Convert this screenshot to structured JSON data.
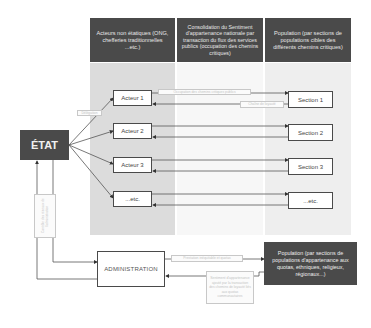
{
  "columns": [
    {
      "header": "Acteurs non étatiques (ONG, chefferies traditionnelles ...etc.)"
    },
    {
      "header": "Consolidation du Sentiment d'appartenance nationale par transaction du flux des services publics (occupation des chemins critiques)"
    },
    {
      "header": "Population (par sections de populations cibles des différents chemins critiques)"
    }
  ],
  "state": {
    "label": "ÉTAT"
  },
  "actors": [
    {
      "label": "Acteur 1"
    },
    {
      "label": "Acteur 2"
    },
    {
      "label": "Acteur 3"
    },
    {
      "label": "...etc."
    }
  ],
  "sections": [
    {
      "label": "Section 1"
    },
    {
      "label": "Section 2"
    },
    {
      "label": "Section 3"
    },
    {
      "label": "...etc."
    }
  ],
  "administration": {
    "label": "ADMINISTRATION"
  },
  "population_bottom": {
    "label": "Population (par sections de populations d'appartenance aux quotas, ethniques, religieux, régionaux...)"
  },
  "edge_labels": {
    "state_to_actors": "Délégation",
    "actor1_to_section1": "Occupation des chemins critiques publics",
    "section1_to_actor1": "Chaîne de loyauté",
    "admin_to_population": "Prestation inéquitable et quotas",
    "population_to_admin": "Sentiment d'appartenance ajouté par la transaction des chemins de loyauté liés aux quotas communautaires",
    "admin_to_state": "Contrôle des réseaux de l'administration"
  },
  "colors": {
    "dark_fill": "#4a4a4a",
    "band_gray": "#dcdcdc",
    "line": "#555555"
  }
}
